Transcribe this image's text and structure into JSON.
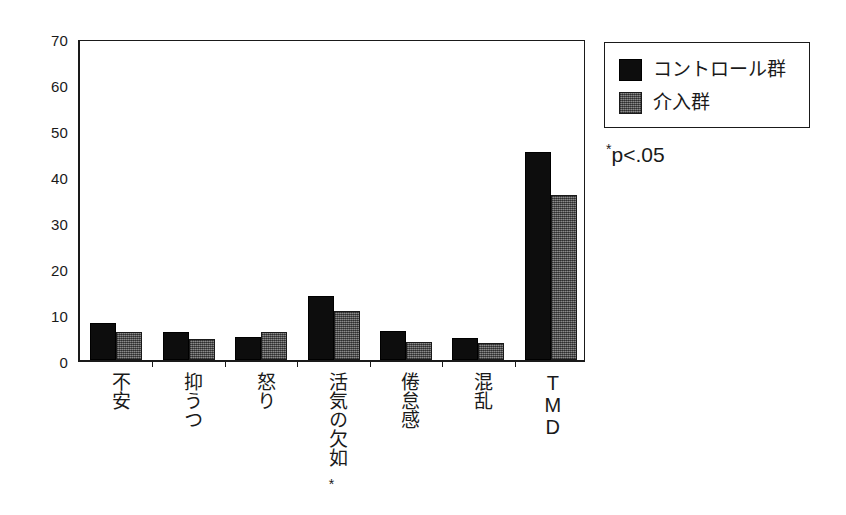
{
  "chart_data": {
    "type": "bar",
    "title": "",
    "xlabel": "",
    "ylabel": "",
    "ylim": [
      0,
      70
    ],
    "yticks": [
      0,
      10,
      20,
      30,
      40,
      50,
      60,
      70
    ],
    "grid": false,
    "legend_position": "right-top",
    "categories": [
      "不安",
      "抑うつ",
      "怒り",
      "活気の欠如",
      "倦怠感",
      "混乱",
      "TMD"
    ],
    "category_annotations": [
      "",
      "",
      "",
      "*",
      "",
      "",
      ""
    ],
    "series": [
      {
        "name": "コントロール群",
        "color": "#0d0d0d",
        "values": [
          8,
          6,
          5,
          14,
          6.3,
          4.8,
          45.3
        ]
      },
      {
        "name": "介入群",
        "color": "#6b6b6b",
        "values": [
          6,
          4.5,
          6,
          10.7,
          4,
          3.8,
          35.8
        ]
      }
    ],
    "annotations": [
      "*p<.05"
    ]
  },
  "legend": {
    "entries": [
      {
        "label": "コントロール群",
        "swatch": "control"
      },
      {
        "label": "介入群",
        "swatch": "intervention"
      }
    ]
  },
  "significance": {
    "star": "*",
    "text": "p<.05"
  },
  "axis": {
    "y_tick_labels": [
      "70",
      "60",
      "50",
      "40",
      "30",
      "20",
      "10",
      "0"
    ]
  }
}
